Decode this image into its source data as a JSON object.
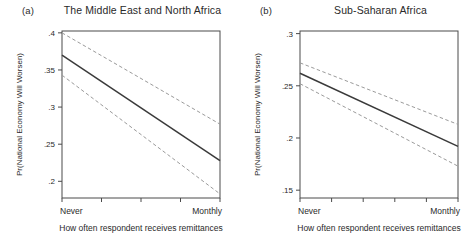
{
  "figure": {
    "background_color": "#ffffff",
    "line_color": "#3a3a3a",
    "ci_color": "#9a9a9a",
    "axis_color": "#4a4a4a"
  },
  "chart_data": [
    {
      "type": "line",
      "panel_tag": "(a)",
      "title": "The Middle East and North Africa",
      "xlabel": "How often respondent receives remittances",
      "ylabel": "Pr(National Economy Will Worsen)",
      "xlim": [
        0,
        1
      ],
      "ylim": [
        0.1775,
        0.4025
      ],
      "xtick_labels": [
        "Never",
        "Monthly"
      ],
      "xtick_positions": [
        0,
        1
      ],
      "xtick_minor_positions": [
        0,
        0.25,
        0.5,
        0.75,
        1
      ],
      "ytick_labels": [
        ".4",
        ".35",
        ".3",
        ".25",
        ".2"
      ],
      "ytick_values": [
        0.4,
        0.35,
        0.3,
        0.25,
        0.2
      ],
      "grid": false,
      "legend": "none",
      "series": [
        {
          "name": "Predicted probability",
          "style": "solid",
          "x": [
            0,
            1
          ],
          "values": [
            0.37,
            0.228
          ]
        },
        {
          "name": "95% CI upper",
          "style": "dashed",
          "x": [
            0,
            1
          ],
          "values": [
            0.4,
            0.277
          ]
        },
        {
          "name": "95% CI lower",
          "style": "dashed",
          "x": [
            0,
            1
          ],
          "values": [
            0.343,
            0.183
          ]
        }
      ]
    },
    {
      "type": "line",
      "panel_tag": "(b)",
      "title": "Sub-Saharan Africa",
      "xlabel": "How often respondent receives remittances",
      "ylabel": "Pr(National Economy Will Worsen)",
      "xlim": [
        0,
        1
      ],
      "ylim": [
        0.1425,
        0.3025
      ],
      "xtick_labels": [
        "Never",
        "Monthly"
      ],
      "xtick_positions": [
        0,
        1
      ],
      "xtick_minor_positions": [
        0,
        0.2,
        0.4,
        0.6,
        0.8,
        1
      ],
      "ytick_labels": [
        ".3",
        ".25",
        ".2",
        ".15"
      ],
      "ytick_values": [
        0.3,
        0.25,
        0.2,
        0.15
      ],
      "grid": false,
      "legend": "none",
      "series": [
        {
          "name": "Predicted probability",
          "style": "solid",
          "x": [
            0,
            1
          ],
          "values": [
            0.262,
            0.192
          ]
        },
        {
          "name": "95% CI upper",
          "style": "dashed",
          "x": [
            0,
            1
          ],
          "values": [
            0.272,
            0.213
          ]
        },
        {
          "name": "95% CI lower",
          "style": "dashed",
          "x": [
            0,
            1
          ],
          "values": [
            0.252,
            0.173
          ]
        }
      ]
    }
  ]
}
